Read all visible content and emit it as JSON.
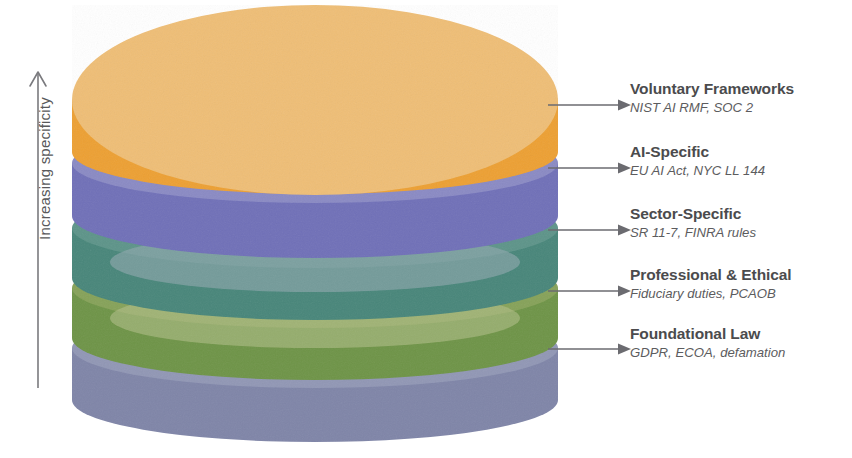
{
  "figure": {
    "type": "layered-cylinder-diagram",
    "axis": {
      "label": "Increasing specificity",
      "direction": "up",
      "icon": "up-arrow-icon"
    },
    "background_color": "#ffffff",
    "text_color": "#4b4b4d",
    "connector_color": "#6b6b70",
    "layers": [
      {
        "title": "Voluntary Frameworks",
        "subtitle": "NIST AI RMF, SOC 2",
        "top_color": "#efbe76",
        "side_color": "#eda033",
        "order": 1
      },
      {
        "title": "AI-Specific",
        "subtitle": "EU AI Act, NYC LL 144",
        "top_color": "#8a8ac4",
        "side_color": "#7070b8",
        "order": 2
      },
      {
        "title": "Sector-Specific",
        "subtitle": "SR 11-7, FINRA rules",
        "top_color": "#5d9489",
        "side_color": "#48867a",
        "order": 3
      },
      {
        "title": "Professional & Ethical",
        "subtitle": "Fiduciary duties, PCAOB",
        "top_color": "#86a259",
        "side_color": "#6e9447",
        "order": 4
      },
      {
        "title": "Foundational Law",
        "subtitle": "GDPR, ECOA, defamation",
        "top_color": "#9197b5",
        "side_color": "#7f85a8",
        "order": 5
      }
    ]
  }
}
